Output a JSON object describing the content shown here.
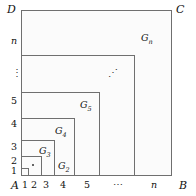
{
  "figure": {
    "type": "nested-squares-diagram",
    "outer_square": {
      "corners": {
        "top_left": "D",
        "top_right": "C",
        "bottom_left": "A",
        "bottom_right": "B"
      }
    },
    "left_axis": {
      "ticks": [
        "1",
        "2",
        "3",
        "4",
        "5"
      ],
      "ellipsis": "⋮",
      "last_tick": "n"
    },
    "bottom_axis": {
      "origin": "A",
      "ticks": [
        "1",
        "2",
        "3",
        "4",
        "5"
      ],
      "ellipsis": "⋯",
      "last_tick": "n",
      "end": "B"
    },
    "regions": [
      {
        "name": "G",
        "sub": "1"
      },
      {
        "name": "G",
        "sub": "2"
      },
      {
        "name": "G",
        "sub": "3"
      },
      {
        "name": "G",
        "sub": "4"
      },
      {
        "name": "G",
        "sub": "5"
      },
      {
        "name": "G",
        "sub": "n"
      }
    ],
    "diagonal_ellipsis": "⋰",
    "colors": {
      "line": "#6f6f6f",
      "fill": "#fbfbfb",
      "text": "#111111"
    }
  }
}
